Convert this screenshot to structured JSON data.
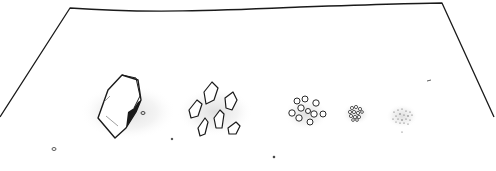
{
  "illustration": {
    "description": "Line drawing of a surface with rock fragments decreasing in size from left to right",
    "groups": [
      {
        "name": "single-large-rock",
        "count": 1
      },
      {
        "name": "medium-fragments",
        "count": 7
      },
      {
        "name": "small-pebbles",
        "count": 10
      },
      {
        "name": "tiny-granules",
        "count": 12
      },
      {
        "name": "fine-dust",
        "count": 20
      }
    ],
    "colors": {
      "line": "#1a1a1a",
      "shadow": "#e6e6e6",
      "background": "#ffffff"
    }
  }
}
